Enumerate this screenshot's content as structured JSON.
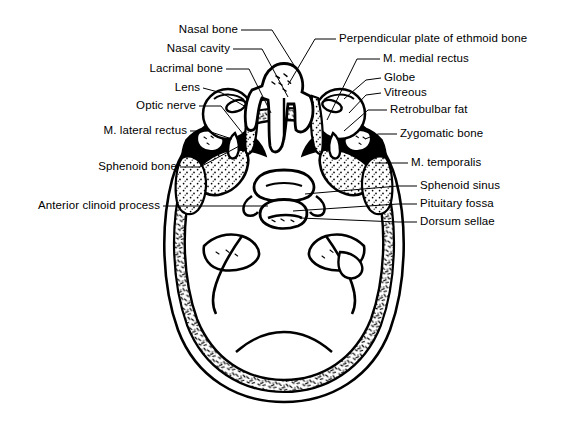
{
  "figure": {
    "ink_color": "#000000",
    "background_color": "#ffffff"
  },
  "labels_left": [
    {
      "id": "nasal-bone",
      "text": "Nasal bone",
      "x": 238,
      "y": 30,
      "lead": [
        [
          241,
          30
        ],
        [
          272,
          30
        ],
        [
          302,
          78
        ]
      ]
    },
    {
      "id": "nasal-cavity",
      "text": "Nasal cavity",
      "x": 230,
      "y": 49,
      "lead": [
        [
          233,
          49
        ],
        [
          262,
          49
        ],
        [
          288,
          97
        ]
      ]
    },
    {
      "id": "lacrimal-bone",
      "text": "Lacrimal bone",
      "x": 223,
      "y": 69,
      "lead": [
        [
          226,
          69
        ],
        [
          249,
          69
        ],
        [
          271,
          113
        ]
      ]
    },
    {
      "id": "lens",
      "text": "Lens",
      "x": 200,
      "y": 88,
      "lead": [
        [
          203,
          88
        ],
        [
          222,
          93
        ],
        [
          246,
          107
        ]
      ]
    },
    {
      "id": "optic-nerve",
      "text": "Optic nerve",
      "x": 196,
      "y": 106,
      "lead": [
        [
          199,
          106
        ],
        [
          221,
          106
        ],
        [
          247,
          139
        ]
      ]
    },
    {
      "id": "m-lateral-rectus",
      "text": "M. lateral rectus",
      "x": 187,
      "y": 131,
      "lead": [
        [
          190,
          131
        ],
        [
          208,
          131
        ],
        [
          232,
          139
        ]
      ]
    },
    {
      "id": "sphenoid-bone",
      "text": "Sphenoid bone",
      "x": 177,
      "y": 167,
      "lead": [
        [
          180,
          167
        ],
        [
          200,
          167
        ],
        [
          243,
          144
        ]
      ]
    },
    {
      "id": "anterior-clinoid-process",
      "text": "Anterior clinoid process",
      "x": 160,
      "y": 206,
      "lead": [
        [
          163,
          206
        ],
        [
          182,
          206
        ],
        [
          268,
          206
        ]
      ]
    }
  ],
  "labels_right": [
    {
      "id": "perpendicular-plate-ethmoid",
      "text": "Perpendicular plate of ethmoid bone",
      "x": 339,
      "y": 39,
      "lead": [
        [
          336,
          39
        ],
        [
          315,
          39
        ],
        [
          288,
          85
        ]
      ]
    },
    {
      "id": "m-medial-rectus",
      "text": "M. medial rectus",
      "x": 383,
      "y": 59,
      "lead": [
        [
          380,
          59
        ],
        [
          357,
          59
        ],
        [
          327,
          120
        ]
      ]
    },
    {
      "id": "globe",
      "text": "Globe",
      "x": 384,
      "y": 78,
      "lead": [
        [
          381,
          78
        ],
        [
          366,
          80
        ],
        [
          344,
          99
        ]
      ]
    },
    {
      "id": "vitreous",
      "text": "Vitreous",
      "x": 384,
      "y": 93,
      "lead": [
        [
          381,
          93
        ],
        [
          366,
          95
        ],
        [
          349,
          113
        ]
      ]
    },
    {
      "id": "retrobulbar-fat",
      "text": "Retrobulbar fat",
      "x": 390,
      "y": 110,
      "lead": [
        [
          387,
          110
        ],
        [
          368,
          110
        ],
        [
          344,
          131
        ]
      ]
    },
    {
      "id": "zygomatic-bone",
      "text": "Zygomatic bone",
      "x": 400,
      "y": 134,
      "lead": [
        [
          397,
          134
        ],
        [
          378,
          134
        ],
        [
          365,
          139
        ]
      ]
    },
    {
      "id": "m-temporalis",
      "text": "M. temporalis",
      "x": 411,
      "y": 163,
      "lead": [
        [
          408,
          163
        ],
        [
          390,
          163
        ],
        [
          375,
          163
        ]
      ]
    },
    {
      "id": "sphenoid-sinus",
      "text": "Sphenoid sinus",
      "x": 420,
      "y": 186,
      "lead": [
        [
          417,
          186
        ],
        [
          398,
          186
        ],
        [
          305,
          194
        ]
      ]
    },
    {
      "id": "pituitary-fossa",
      "text": "Pituitary fossa",
      "x": 420,
      "y": 204,
      "lead": [
        [
          417,
          204
        ],
        [
          398,
          204
        ],
        [
          293,
          211
        ]
      ]
    },
    {
      "id": "dorsum-sellae",
      "text": "Dorsum sellae",
      "x": 420,
      "y": 222,
      "lead": [
        [
          417,
          222
        ],
        [
          398,
          222
        ],
        [
          300,
          218
        ]
      ]
    }
  ]
}
